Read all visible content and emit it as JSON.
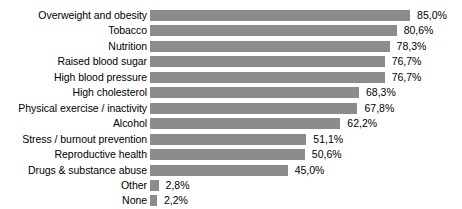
{
  "chart_data": {
    "type": "bar",
    "orientation": "horizontal",
    "title": "",
    "subtitle": "",
    "xlabel": "",
    "ylabel": "",
    "xlim": [
      0,
      100
    ],
    "grid": false,
    "legend": "none",
    "value_suffix": "%",
    "decimal_separator": ",",
    "bar_color": "#8c8c8c",
    "background_color": "#ffffff",
    "text_color": "#000000",
    "categories": [
      "Overweight and obesity",
      "Tobacco",
      "Nutrition",
      "Raised blood sugar",
      "High blood pressure",
      "High cholesterol",
      "Physical exercise / inactivity",
      "Alcohol",
      "Stress / burnout prevention",
      "Reproductive health",
      "Drugs & substance abuse",
      "Other",
      "None"
    ],
    "values": [
      85.0,
      80.6,
      78.3,
      76.7,
      76.7,
      68.3,
      67.8,
      62.2,
      51.1,
      50.6,
      45.0,
      2.8,
      2.2
    ],
    "value_labels": [
      "85,0%",
      "80,6%",
      "78,3%",
      "76,7%",
      "76,7%",
      "68,3%",
      "67,8%",
      "62,2%",
      "51,1%",
      "50,6%",
      "45,0%",
      "2,8%",
      "2,2%"
    ]
  }
}
